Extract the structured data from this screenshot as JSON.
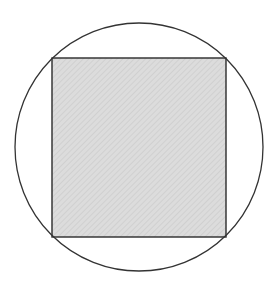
{
  "diagram": {
    "type": "square-inscribed-in-circle",
    "width": 276,
    "height": 282,
    "circle": {
      "cx": 139,
      "cy": 147,
      "r": 124,
      "stroke": "#333333",
      "stroke_width": 1.3,
      "fill": "none"
    },
    "square": {
      "x": 52,
      "y": 58,
      "width": 174,
      "height": 179,
      "stroke": "#2b2b2b",
      "stroke_width": 1.4,
      "fill": "#dcdcdc",
      "hatch_color": "#c8c8c8",
      "hatch_spacing": 4,
      "hatch_direction": "diagonal-down-right",
      "shaded": true
    },
    "background": "#ffffff"
  }
}
